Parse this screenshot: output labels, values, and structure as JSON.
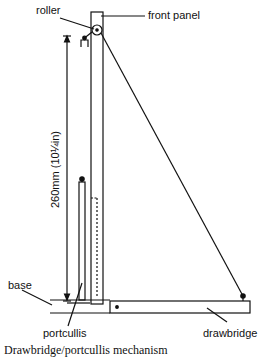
{
  "diagram": {
    "labels": {
      "roller": "roller",
      "front_panel": "front panel",
      "base": "base",
      "portcullis": "portcullis",
      "drawbridge": "drawbridge"
    },
    "dimension": "260mm (10¼in)",
    "caption": "Drawbridge/portcullis mechanism"
  }
}
